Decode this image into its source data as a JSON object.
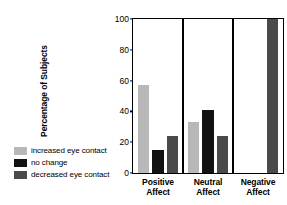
{
  "chart_data": {
    "type": "bar",
    "title": "",
    "xlabel": "",
    "ylabel": "Percentage of Subjects",
    "ylim": [
      0,
      100
    ],
    "yticks": [
      0,
      20,
      40,
      60,
      80,
      100
    ],
    "ytick_labels": [
      "0",
      "20",
      "40",
      "60",
      "80",
      "100"
    ],
    "grid": false,
    "legend_position": "left-outside",
    "categories": [
      "Positive Affect",
      "Neutral Affect",
      "Negative Affect"
    ],
    "category_lines": [
      [
        "Positive",
        "Affect"
      ],
      [
        "Neutral",
        "Affect"
      ],
      [
        "Negative",
        "Affect"
      ]
    ],
    "series": [
      {
        "name": "increased eye contact",
        "color": "#b8b8b8",
        "values": [
          57,
          33,
          0
        ]
      },
      {
        "name": "no change",
        "color": "#121212",
        "values": [
          15,
          41,
          0
        ]
      },
      {
        "name": "decreased eye contact",
        "color": "#4a4a4a",
        "values": [
          24,
          24,
          100
        ]
      }
    ]
  },
  "legend": {
    "items": [
      {
        "label": "increased eye contact",
        "color": "#b8b8b8"
      },
      {
        "label": "no change",
        "color": "#121212"
      },
      {
        "label": "decreased eye contact",
        "color": "#4a4a4a"
      }
    ]
  },
  "axis": {
    "y_title": "Percentage of Subjects"
  },
  "colors": {
    "increased": "#b8b8b8",
    "no_change": "#121212",
    "decreased": "#4a4a4a",
    "axis": "#000000",
    "background": "#ffffff"
  }
}
